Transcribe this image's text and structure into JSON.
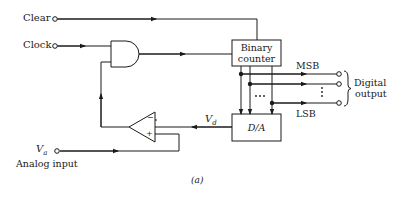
{
  "diagram": {
    "inputs": {
      "clear": "Clear",
      "clock": "Clock",
      "analog_symbol": "V",
      "analog_subscript": "a",
      "analog_label": "Analog input"
    },
    "blocks": {
      "counter_line1": "Binary",
      "counter_line2": "counter",
      "dac": "D/A"
    },
    "signals": {
      "vd_symbol": "V",
      "vd_subscript": "d",
      "msb": "MSB",
      "lsb": "LSB",
      "comparator_minus": "−",
      "comparator_plus": "+"
    },
    "outputs": {
      "line1": "Digital",
      "line2": "output"
    },
    "caption": "(a)",
    "colors": {
      "ink": "#1a1a1a",
      "background": "#ffffff"
    }
  }
}
